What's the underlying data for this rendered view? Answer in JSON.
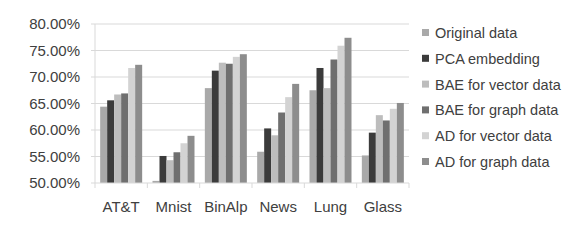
{
  "chart_data": {
    "type": "bar",
    "title": "",
    "xlabel": "",
    "ylabel": "",
    "ylim": [
      0.5,
      0.8
    ],
    "yticks": [
      "50.00%",
      "55.00%",
      "60.00%",
      "65.00%",
      "70.00%",
      "75.00%",
      "80.00%"
    ],
    "grid": true,
    "legend_position": "right",
    "categories": [
      "AT&T",
      "Mnist",
      "BinAlp",
      "News",
      "Lung",
      "Glass"
    ],
    "series": [
      {
        "name": "Original data",
        "color": "#a9a9a9",
        "values": [
          0.644,
          0.504,
          0.679,
          0.559,
          0.675,
          0.552
        ]
      },
      {
        "name": "PCA embedding",
        "color": "#3b3b3b",
        "values": [
          0.656,
          0.551,
          0.712,
          0.603,
          0.717,
          0.595
        ]
      },
      {
        "name": "BAE for vector data",
        "color": "#bdbdbd",
        "values": [
          0.667,
          0.543,
          0.727,
          0.59,
          0.679,
          0.628
        ]
      },
      {
        "name": "BAE for graph data",
        "color": "#6f6f6f",
        "values": [
          0.669,
          0.558,
          0.725,
          0.633,
          0.733,
          0.618
        ]
      },
      {
        "name": "AD for vector data",
        "color": "#d3d3d3",
        "values": [
          0.717,
          0.575,
          0.738,
          0.662,
          0.759,
          0.64
        ]
      },
      {
        "name": "AD for graph data",
        "color": "#8d8d8d",
        "values": [
          0.723,
          0.589,
          0.743,
          0.687,
          0.774,
          0.651
        ]
      }
    ]
  },
  "colors": {
    "axis": "#d9d9d9",
    "gridline": "#d9d9d9",
    "text": "#404040"
  }
}
